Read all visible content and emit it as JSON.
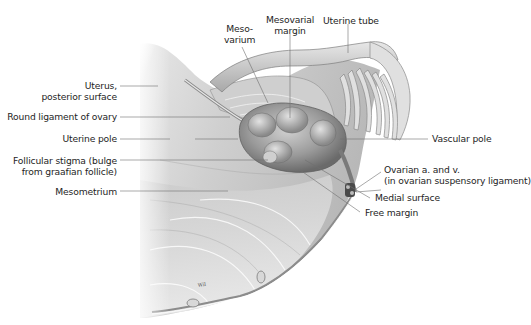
{
  "figure": {
    "colors": {
      "background": "#ffffff",
      "tissue_light": "#e6e6e6",
      "tissue_mid": "#bdbdbd",
      "tissue_dark": "#7a7a7a",
      "leader_line": "#6e6e6e",
      "label_text": "#1e1e1e"
    },
    "signature": "Wil"
  },
  "labels": {
    "mesovarium": {
      "line1": "Meso-",
      "line2": "varium"
    },
    "mesovarial_margin": {
      "line1": "Mesovarial",
      "line2": "margin"
    },
    "uterine_tube": {
      "line1": "Uterine tube"
    },
    "uterus_posterior_surface": {
      "line1": "Uterus,",
      "line2": "posterior surface"
    },
    "round_ligament": {
      "line1": "Round ligament of ovary"
    },
    "uterine_pole": {
      "line1": "Uterine pole"
    },
    "follicular_stigma": {
      "line1": "Follicular stigma (bulge",
      "line2": "from graafian follicle)"
    },
    "mesometrium": {
      "line1": "Mesometrium"
    },
    "vascular_pole": {
      "line1": "Vascular pole"
    },
    "ovarian_vessels": {
      "line1": "Ovarian a. and v.",
      "line2": "(in ovarian suspensory ligament)"
    },
    "medial_surface": {
      "line1": "Medial surface"
    },
    "free_margin": {
      "line1": "Free margin"
    }
  }
}
